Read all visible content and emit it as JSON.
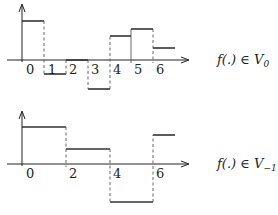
{
  "diagrams": [
    {
      "id": "v0",
      "caption": "f(.) ∈ V",
      "caption_sub": "0",
      "x_ticks": [
        "0",
        "1",
        "2",
        "3",
        "4",
        "5",
        "6"
      ],
      "segments": [
        {
          "x0": 0,
          "x1": 1,
          "level": 1.0
        },
        {
          "x0": 1,
          "x1": 2,
          "level": -0.35
        },
        {
          "x0": 2,
          "x1": 3,
          "level": 0.0
        },
        {
          "x0": 3,
          "x1": 4,
          "level": -0.75
        },
        {
          "x0": 4,
          "x1": 5,
          "level": 0.6
        },
        {
          "x0": 5,
          "x1": 6,
          "level": 0.8
        },
        {
          "x0": 6,
          "x1": 7,
          "level": 0.3
        }
      ]
    },
    {
      "id": "v-1",
      "caption": "f(.) ∈ V",
      "caption_sub": "−1",
      "x_ticks": [
        "0",
        "2",
        "4",
        "6"
      ],
      "segments": [
        {
          "x0": 0,
          "x1": 2,
          "level": 1.0
        },
        {
          "x0": 2,
          "x1": 4,
          "level": 0.4
        },
        {
          "x0": 4,
          "x1": 6,
          "level": -1.05
        },
        {
          "x0": 6,
          "x1": 7,
          "level": 0.8
        }
      ]
    }
  ]
}
